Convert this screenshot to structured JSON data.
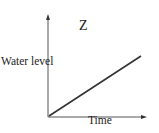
{
  "chart_data": {
    "type": "line",
    "title": "Z",
    "xlabel": "Time",
    "ylabel": "Water level",
    "series": [
      {
        "name": "Water level",
        "x": [
          0,
          1
        ],
        "values": [
          0,
          0.6
        ]
      }
    ],
    "xlim": [
      0,
      1
    ],
    "ylim": [
      0,
      1
    ],
    "grid": false,
    "legend": "none",
    "ticks": false
  },
  "colors": {
    "axis": "#333333",
    "line": "#333333"
  }
}
